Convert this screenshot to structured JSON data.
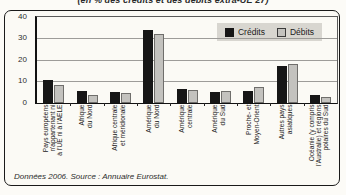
{
  "title": "(en % des crédits et des débits extra-UE 27)",
  "legend": {
    "credits_label": "Crédits",
    "debits_label": "Débits"
  },
  "footer": {
    "text": "Données 2006. Source : Annuaire Eurostat."
  },
  "colors": {
    "credits_bar": "#161616",
    "debits_bar": "#c3c2be",
    "legend_bg": "#d8d6d0",
    "gridline": "#9d9c99",
    "box_bg": "#fbfaf5"
  },
  "chart_data": {
    "type": "bar",
    "title": "(en % des crédits et des débits extra-UE 27)",
    "source": "Données 2006. Source : Annuaire Eurostat.",
    "categories": [
      "Pays européens\nn'appartenant ni\nà l'UE ni à l'AELE",
      "Afrique\ndu Nord",
      "Afrique centrale\net méridionale",
      "Amérique\ndu Nord",
      "Amérique\ncentrale",
      "Amérique\ndu Sud",
      "Proche- et\nMoyen-Orient",
      "Autres pays\nasiatiques",
      "Océanie (y compris\nl'Australie) et régions\npolaires du Sud"
    ],
    "series": [
      {
        "name": "Crédits",
        "color": "#161616",
        "values": [
          10.5,
          5.5,
          5,
          34,
          6.5,
          5,
          5.5,
          17,
          3.5
        ]
      },
      {
        "name": "Débits",
        "color": "#c3c2be",
        "values": [
          8.5,
          3.5,
          4.5,
          32,
          6,
          5.5,
          7.5,
          18,
          3
        ]
      }
    ],
    "ylim": [
      0,
      40
    ],
    "yticks": [
      0,
      10,
      20,
      30,
      40
    ],
    "xlabel": "",
    "ylabel": "",
    "grid": true,
    "legend_position": "top-right"
  }
}
